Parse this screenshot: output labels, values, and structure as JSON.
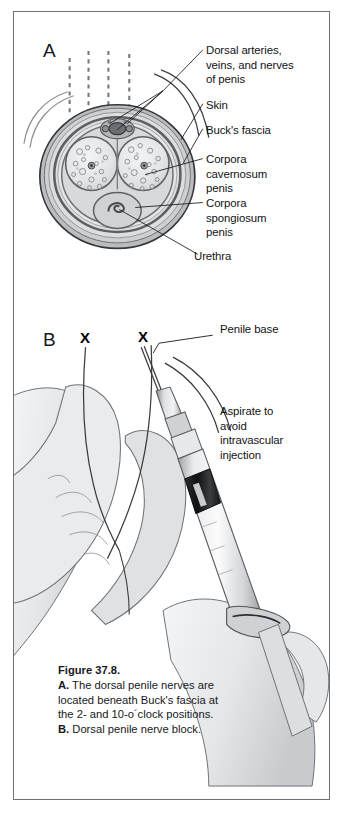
{
  "figure": {
    "panels": [
      {
        "letter": "A",
        "name": "penile-cross-section",
        "labels": [
          {
            "id": "dorsal-vessels",
            "text": "Dorsal arteries,\nveins, and nerves\nof penis"
          },
          {
            "id": "skin",
            "text": "Skin"
          },
          {
            "id": "bucks-fascia",
            "text": "Buck's fascia"
          },
          {
            "id": "corpora-cavernosum",
            "text": "Corpora\ncavernosum\npenis"
          },
          {
            "id": "corpora-spongiosum",
            "text": "Corpora\nspongiosum\npenis"
          },
          {
            "id": "urethra",
            "text": "Urethra"
          }
        ]
      },
      {
        "letter": "B",
        "name": "dorsal-penile-nerve-block-injection",
        "labels": [
          {
            "id": "penile-base",
            "text": "Penile base"
          },
          {
            "id": "aspirate-note",
            "text": "Aspirate to\navoid\nintravascular\ninjection"
          }
        ],
        "markers": [
          {
            "id": "injection-site-left",
            "text": "X"
          },
          {
            "id": "injection-site-right",
            "text": "X"
          }
        ]
      }
    ],
    "caption": {
      "title": "Figure 37.8.",
      "part_a_tag": "A.",
      "part_a_text": " The dorsal penile nerves are located beneath Buck's fascia at the 2- and 10-o´clock positions.",
      "part_b_tag": "B.",
      "part_b_text": " Dorsal penile nerve block."
    }
  },
  "colors": {
    "frame": "#6f7175",
    "ink": "#16181b",
    "page": "#ffffff",
    "tissue_light": "#ebeced",
    "tissue_mid": "#c9cbcd",
    "tissue_dark": "#9b9ea1",
    "outline": "#3a3c3f",
    "skin_light": "#eceef0",
    "skin_shade": "#c3c6ca"
  }
}
